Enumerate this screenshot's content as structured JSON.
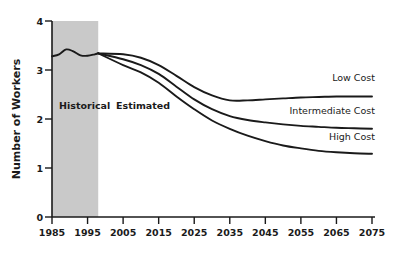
{
  "chart_data": {
    "type": "line",
    "title": "",
    "xlabel": "",
    "ylabel": "Number of Workers",
    "xlim": [
      1985,
      2075
    ],
    "ylim": [
      0,
      4
    ],
    "grid": false,
    "legend_position": "inline-right-end",
    "x_ticks": [
      "1985",
      "1995",
      "2005",
      "2015",
      "2025",
      "2035",
      "2045",
      "2055",
      "2065",
      "2075"
    ],
    "y_ticks": [
      "0",
      "1",
      "2",
      "3",
      "4"
    ],
    "annotations": [
      {
        "text": "Historical",
        "x": 1987,
        "y": 2.2
      },
      {
        "text": "Estimated",
        "x": 2003,
        "y": 2.2
      }
    ],
    "shaded_region": {
      "label": "Historical",
      "x_start": 1985,
      "x_end": 1998,
      "color": "#c9c9c9"
    },
    "historical": {
      "name": "Historical",
      "x": [
        1985,
        1987,
        1989,
        1991,
        1993,
        1995,
        1997,
        1998
      ],
      "values": [
        3.28,
        3.32,
        3.42,
        3.38,
        3.3,
        3.29,
        3.32,
        3.34
      ]
    },
    "series": [
      {
        "name": "Low Cost",
        "x": [
          1998,
          2005,
          2010,
          2015,
          2020,
          2025,
          2030,
          2035,
          2040,
          2045,
          2050,
          2055,
          2060,
          2065,
          2070,
          2075
        ],
        "values": [
          3.34,
          3.32,
          3.25,
          3.1,
          2.88,
          2.65,
          2.48,
          2.38,
          2.38,
          2.4,
          2.42,
          2.44,
          2.45,
          2.46,
          2.46,
          2.46
        ]
      },
      {
        "name": "Intermediate Cost",
        "x": [
          1998,
          2005,
          2010,
          2015,
          2020,
          2025,
          2030,
          2035,
          2040,
          2045,
          2050,
          2055,
          2060,
          2065,
          2070,
          2075
        ],
        "values": [
          3.34,
          3.22,
          3.1,
          2.92,
          2.66,
          2.4,
          2.2,
          2.06,
          1.98,
          1.93,
          1.89,
          1.86,
          1.84,
          1.82,
          1.81,
          1.8
        ]
      },
      {
        "name": "High Cost",
        "x": [
          1998,
          2005,
          2010,
          2015,
          2020,
          2025,
          2030,
          2035,
          2040,
          2045,
          2050,
          2055,
          2060,
          2065,
          2070,
          2075
        ],
        "values": [
          3.34,
          3.1,
          2.95,
          2.74,
          2.46,
          2.2,
          1.97,
          1.8,
          1.66,
          1.55,
          1.46,
          1.4,
          1.35,
          1.32,
          1.3,
          1.29
        ]
      }
    ],
    "series_labels": [
      {
        "name": "Low Cost",
        "label_y": 2.78
      },
      {
        "name": "Intermediate Cost",
        "label_y": 2.1
      },
      {
        "name": "High Cost",
        "label_y": 1.58
      }
    ]
  }
}
